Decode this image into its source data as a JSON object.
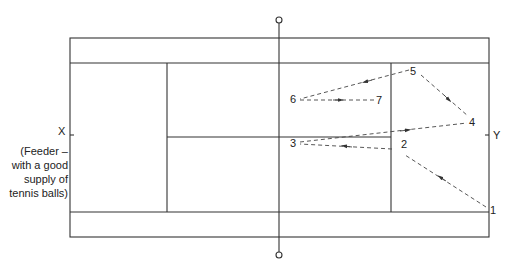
{
  "diagram": {
    "type": "tennis-court-drill",
    "side_labels": {
      "left": "X",
      "left_note": "(Feeder – with a good supply of tennis balls)",
      "right": "Y"
    },
    "positions": [
      {
        "id": "1",
        "label": "1",
        "x": 489,
        "y": 210
      },
      {
        "id": "2",
        "label": "2",
        "x": 401,
        "y": 146
      },
      {
        "id": "3",
        "label": "3",
        "x": 293,
        "y": 143
      },
      {
        "id": "4",
        "label": "4",
        "x": 472,
        "y": 122
      },
      {
        "id": "5",
        "label": "5",
        "x": 414,
        "y": 70
      },
      {
        "id": "6",
        "label": "6",
        "x": 292,
        "y": 98
      },
      {
        "id": "7",
        "label": "7",
        "x": 378,
        "y": 100
      }
    ],
    "paths": [
      {
        "from": "1",
        "to": "2"
      },
      {
        "from": "2",
        "to": "3"
      },
      {
        "from": "3",
        "to": "4"
      },
      {
        "from": "4",
        "to": "5",
        "note": "arrow toward 4 from 5"
      },
      {
        "from": "5",
        "to": "6"
      },
      {
        "from": "6",
        "to": "7"
      }
    ],
    "colors": {
      "line": "#333333",
      "dash": "#444444"
    }
  }
}
